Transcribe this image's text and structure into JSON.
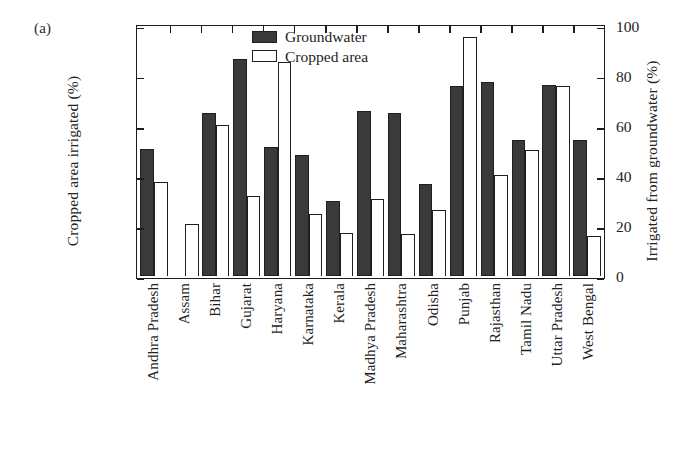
{
  "panel": {
    "label": "(a)"
  },
  "axes": {
    "ylabel_left": "Cropped area irrigated (%)",
    "ylabel_right": "Irrigated from groundwater (%)",
    "ticks": [
      "0",
      "20",
      "40",
      "60",
      "80",
      "100"
    ],
    "ymin": 0,
    "ymax": 100
  },
  "legend": {
    "items": [
      {
        "label": "Groundwater",
        "style": "dark"
      },
      {
        "label": "Cropped area",
        "style": "open"
      }
    ]
  },
  "chart_data": {
    "type": "bar",
    "title": "",
    "xlabel": "",
    "ylabel": "Cropped area irrigated (%)",
    "ylabel_secondary": "Irrigated from groundwater (%)",
    "ylim": [
      0,
      100
    ],
    "ylim_secondary": [
      0,
      100
    ],
    "yticks": [
      0,
      20,
      40,
      60,
      80,
      100
    ],
    "grid": false,
    "legend_position": "top-center",
    "categories": [
      "Andhra Pradesh",
      "Assam",
      "Bihar",
      "Gujarat",
      "Haryana",
      "Karnataka",
      "Kerala",
      "Madhya Pradesh",
      "Maharashtra",
      "Odisha",
      "Punjab",
      "Rajasthan",
      "Tamil Nadu",
      "Uttar Pradesh",
      "West Bengal"
    ],
    "series": [
      {
        "name": "Groundwater",
        "axis": "right",
        "values": [
          51,
          0,
          65,
          86.5,
          51.5,
          48.5,
          30,
          66,
          65,
          37,
          76,
          77.5,
          54.5,
          76.5,
          54.5
        ]
      },
      {
        "name": "Cropped area",
        "axis": "left",
        "values": [
          37.5,
          21,
          60.5,
          32,
          85.5,
          25,
          17.5,
          31,
          17,
          26.5,
          95.5,
          40.5,
          50.5,
          76,
          16
        ]
      }
    ]
  },
  "colors": {
    "bar_dark": "#3a3a3a",
    "bar_open": "#ffffff",
    "outline": "#1f1f1f",
    "background": "#ffffff"
  }
}
